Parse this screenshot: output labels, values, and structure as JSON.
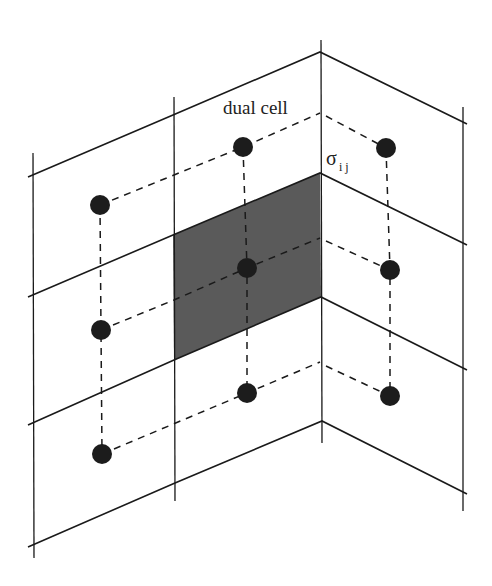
{
  "labels": {
    "dual_cell": "dual cell",
    "sigma": "σ",
    "sigma_sub": "i j"
  },
  "colors": {
    "line": "#1a1a1a",
    "shade": "#5a5a5a",
    "dot": "#1c1c1c",
    "background": "#ffffff"
  },
  "grid": {
    "verticals": [
      {
        "x": 33,
        "y1": 153,
        "y2": 558
      },
      {
        "x": 174,
        "y1": 97,
        "y2": 501
      },
      {
        "x": 321,
        "y1": 40,
        "y2": 443
      },
      {
        "x": 463,
        "y1": 107,
        "y2": 511
      }
    ],
    "zigzags": [
      [
        [
          28,
          177
        ],
        [
          173,
          115
        ],
        [
          320,
          52
        ],
        [
          467,
          124
        ]
      ],
      [
        [
          28,
          297
        ],
        [
          173,
          235
        ],
        [
          320,
          173
        ],
        [
          467,
          245
        ]
      ],
      [
        [
          28,
          425
        ],
        [
          174,
          360
        ],
        [
          321,
          297
        ],
        [
          467,
          370
        ]
      ],
      [
        [
          28,
          547
        ],
        [
          175,
          483
        ],
        [
          322,
          421
        ],
        [
          467,
          494
        ]
      ]
    ],
    "shaded_cell": [
      [
        173,
        235
      ],
      [
        320,
        173
      ],
      [
        321,
        297
      ],
      [
        174,
        360
      ]
    ]
  },
  "dual_points": [
    {
      "x": 100,
      "y": 205
    },
    {
      "x": 243,
      "y": 147
    },
    {
      "x": 386,
      "y": 148
    },
    {
      "x": 101,
      "y": 330
    },
    {
      "x": 247,
      "y": 268
    },
    {
      "x": 390,
      "y": 270
    },
    {
      "x": 102,
      "y": 454
    },
    {
      "x": 247,
      "y": 393
    },
    {
      "x": 390,
      "y": 396
    }
  ]
}
